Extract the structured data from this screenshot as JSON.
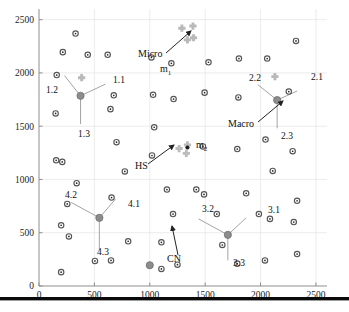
{
  "figure": {
    "title": "",
    "background": "#ffffff",
    "bottom_bar_color": "#0a0a0a"
  },
  "colors": {
    "cn_stroke": "#555555",
    "cn_fill": "#ffffff",
    "cn_dot": "#2a2a2a",
    "macro_fill": "#8c8c8c",
    "macro_stroke": "#6e6e6e",
    "micro_fill": "#b9b9b9",
    "hs_fill": "#bcbcbc",
    "spoke": "#9a9a9a",
    "grid": "#e4e4e4",
    "axis": "#8e8e8e",
    "text": "#111111"
  },
  "chart_data": {
    "type": "scatter",
    "title": "",
    "xlabel": "",
    "ylabel": "",
    "xlim": [
      0,
      2600
    ],
    "ylim": [
      0,
      2600
    ],
    "grid": true,
    "legend_position": "none",
    "xticks": [
      0,
      500,
      1000,
      1500,
      2000,
      2500
    ],
    "yticks": [
      0,
      500,
      1000,
      1500,
      2000,
      2500
    ],
    "xtick_labels": [
      "0",
      "500",
      "1000",
      "1500",
      "2000",
      "2500"
    ],
    "ytick_labels": [
      "0",
      "500",
      "1000",
      "1500",
      "2000",
      "2500"
    ],
    "series": [
      {
        "name": "CN",
        "marker": "cn-node",
        "description": "Candidate node / small open circle with center dot",
        "points": [
          [
            330,
            2370
          ],
          [
            215,
            2195
          ],
          [
            440,
            2170
          ],
          [
            620,
            2170
          ],
          [
            1015,
            2145
          ],
          [
            1195,
            2090
          ],
          [
            1530,
            2100
          ],
          [
            1805,
            2135
          ],
          [
            2060,
            2135
          ],
          [
            2320,
            2300
          ],
          [
            160,
            1980
          ],
          [
            675,
            1790
          ],
          [
            1030,
            1795
          ],
          [
            1215,
            1755
          ],
          [
            1495,
            1815
          ],
          [
            1800,
            1770
          ],
          [
            2255,
            1825
          ],
          [
            150,
            1620
          ],
          [
            645,
            1660
          ],
          [
            1040,
            1490
          ],
          [
            2045,
            1375
          ],
          [
            700,
            1350
          ],
          [
            1480,
            1310
          ],
          [
            1790,
            1285
          ],
          [
            2290,
            1265
          ],
          [
            155,
            1180
          ],
          [
            1020,
            1225
          ],
          [
            2110,
            1080
          ],
          [
            775,
            1075
          ],
          [
            210,
            1165
          ],
          [
            340,
            965
          ],
          [
            1155,
            905
          ],
          [
            1420,
            905
          ],
          [
            1490,
            860
          ],
          [
            1870,
            870
          ],
          [
            2330,
            800
          ],
          [
            655,
            830
          ],
          [
            255,
            770
          ],
          [
            1210,
            675
          ],
          [
            1605,
            675
          ],
          [
            1985,
            675
          ],
          [
            2085,
            630
          ],
          [
            2300,
            600
          ],
          [
            200,
            570
          ],
          [
            270,
            465
          ],
          [
            1105,
            410
          ],
          [
            1655,
            385
          ],
          [
            805,
            420
          ],
          [
            505,
            235
          ],
          [
            650,
            240
          ],
          [
            1105,
            160
          ],
          [
            1250,
            200
          ],
          [
            1790,
            210
          ],
          [
            2040,
            240
          ],
          [
            2330,
            300
          ],
          [
            200,
            130
          ]
        ]
      },
      {
        "name": "Macro",
        "marker": "macro-node",
        "description": "Macro base station / filled gray circle",
        "points": [
          [
            375,
            1785
          ],
          [
            2150,
            1745
          ],
          [
            545,
            640
          ],
          [
            1705,
            480
          ],
          [
            1000,
            195
          ]
        ]
      },
      {
        "name": "Micro",
        "marker": "micro-node",
        "description": "Micro base station / gray cross cluster",
        "points": [
          [
            1290,
            2420
          ],
          [
            1390,
            2440
          ],
          [
            1395,
            2330
          ],
          [
            1340,
            2310
          ],
          [
            385,
            1955
          ],
          [
            2130,
            1965
          ]
        ]
      },
      {
        "name": "HS",
        "marker": "hs-node",
        "description": "Hot spot cluster of micro nodes",
        "points": [
          [
            1265,
            1290
          ],
          [
            1340,
            1325
          ],
          [
            1330,
            1245
          ]
        ]
      },
      {
        "name": "m2_marker",
        "marker": "m2-node",
        "description": "Dark marker at center of HS cluster",
        "points": [
          [
            1340,
            1300
          ]
        ]
      }
    ],
    "spokes": [
      {
        "hub": [
          375,
          1785
        ],
        "ends": [
          [
            230,
            1975
          ],
          [
            600,
            1895
          ],
          [
            375,
            1520
          ]
        ]
      },
      {
        "hub": [
          2150,
          1745
        ],
        "ends": [
          [
            1975,
            1890
          ],
          [
            2330,
            1830
          ],
          [
            2150,
            1480
          ]
        ]
      },
      {
        "hub": [
          545,
          640
        ],
        "ends": [
          [
            290,
            785
          ],
          [
            690,
            815
          ],
          [
            545,
            340
          ]
        ]
      },
      {
        "hub": [
          1705,
          480
        ],
        "ends": [
          [
            1440,
            630
          ],
          [
            1870,
            640
          ],
          [
            1705,
            240
          ]
        ]
      }
    ],
    "node_labels": [
      {
        "text": "1.1",
        "x": 1.1,
        "px": 113,
        "py": 83
      },
      {
        "text": "1.2",
        "x": 1.2,
        "px": 46,
        "py": 93
      },
      {
        "text": "1.3",
        "x": 1.3,
        "px": 78,
        "py": 137
      },
      {
        "text": "2.1",
        "x": 2.1,
        "px": 311,
        "py": 80
      },
      {
        "text": "2.2",
        "x": 2.2,
        "px": 249,
        "py": 81
      },
      {
        "text": "2.3",
        "x": 2.3,
        "px": 281,
        "py": 139
      },
      {
        "text": "3.1",
        "x": 3.1,
        "px": 268,
        "py": 213
      },
      {
        "text": "3.2",
        "x": 3.2,
        "px": 202,
        "py": 212
      },
      {
        "text": "3.3",
        "x": 3.3,
        "px": 233,
        "py": 266
      },
      {
        "text": "4.1",
        "x": 4.1,
        "px": 128,
        "py": 207
      },
      {
        "text": "4.2",
        "x": 4.2,
        "px": 65,
        "py": 198
      },
      {
        "text": "4.3",
        "x": 4.3,
        "px": 97,
        "py": 255
      }
    ],
    "annotations": [
      {
        "label": "Micro",
        "sub_label": "m",
        "sub_index": "1",
        "label_px": [
          138,
          57
        ],
        "sub_px": [
          160,
          72
        ],
        "arrow_from": [
          166,
          53
        ],
        "arrow_to": [
          191,
          31
        ]
      },
      {
        "label": "Macro",
        "sub_label": "",
        "sub_index": "",
        "label_px": [
          228,
          127
        ],
        "arrow_from": [
          258,
          122
        ],
        "arrow_to": [
          283,
          101
        ]
      },
      {
        "label": "HS",
        "sub_label": "m",
        "sub_index": "2",
        "label_px": [
          135,
          169
        ],
        "sub_px": [
          196,
          148
        ],
        "arrow_from": [
          148,
          164
        ],
        "arrow_to": [
          174,
          145
        ]
      },
      {
        "label": "CN",
        "sub_label": "",
        "sub_index": "",
        "label_px": [
          167,
          262
        ],
        "arrow_from": [
          178,
          255
        ],
        "arrow_to": [
          172,
          226
        ]
      }
    ]
  }
}
